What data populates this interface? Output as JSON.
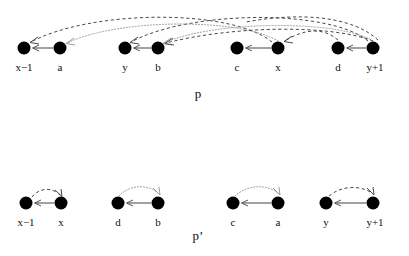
{
  "figure": {
    "title": "",
    "background_color": "#ffffff",
    "node_color": "#000000",
    "solid_edge_color": "#555555",
    "dashed_arc_color": "#4a4a4a",
    "dotted_arc_color": "#9a9a9a"
  },
  "panels": [
    {
      "id": "panel-p",
      "caption": "p",
      "caption_x": 198,
      "caption_y": 92,
      "node_y": 48,
      "label_y": 58,
      "nodes": [
        {
          "id": "n-xm1",
          "label": "x−1",
          "cx": 24,
          "cy": 48,
          "r": 6.5
        },
        {
          "id": "n-a",
          "label": "a",
          "cx": 60,
          "cy": 48,
          "r": 6.5
        },
        {
          "id": "n-y",
          "label": "y",
          "cx": 125,
          "cy": 48,
          "r": 6.5
        },
        {
          "id": "n-b",
          "label": "b",
          "cx": 158,
          "cy": 48,
          "r": 6.5
        },
        {
          "id": "n-c",
          "label": "c",
          "cx": 237,
          "cy": 48,
          "r": 6.5
        },
        {
          "id": "n-x",
          "label": "x",
          "cx": 278,
          "cy": 48,
          "r": 6.5
        },
        {
          "id": "n-d",
          "label": "d",
          "cx": 338,
          "cy": 48,
          "r": 6.5
        },
        {
          "id": "n-yp1",
          "label": "y+1",
          "cx": 373,
          "cy": 48,
          "r": 6.5
        }
      ],
      "solid_edges": [
        {
          "id": "e-a-xm1",
          "from": "a",
          "to": "x−1",
          "x1": 53,
          "x2": 33,
          "y": 48
        },
        {
          "id": "e-b-y",
          "from": "b",
          "to": "y",
          "x1": 151,
          "x2": 134,
          "y": 48
        },
        {
          "id": "e-x-c",
          "from": "x",
          "to": "c",
          "x1": 271,
          "x2": 246,
          "y": 48
        },
        {
          "id": "e-yp1-d",
          "from": "y+1",
          "to": "d",
          "x1": 366,
          "x2": 347,
          "y": 48
        }
      ],
      "curved_arcs": [
        {
          "id": "arc-x-xm1",
          "style": "dashed",
          "from": "x",
          "to": "x−1",
          "d": "M 272 42 C 230 8, 90 10, 31 42"
        },
        {
          "id": "arc-yp1-y",
          "style": "dashed",
          "from": "y+1",
          "to": "y",
          "d": "M 368 41 C 330 9, 190 10, 131 42"
        },
        {
          "id": "arc-b-a",
          "style": "dotted",
          "from": "b",
          "to": "a",
          "d": "M 278 41 C 240 18, 120 18, 67 43"
        },
        {
          "id": "arc-d-c",
          "style": "dotted",
          "from": "d",
          "to": "c",
          "d": "M 373 41 C 340 20, 215 20, 164 43"
        },
        {
          "id": "arc-cross1",
          "style": "dashed",
          "from": "y+1",
          "to": "b",
          "d": "M 373 41 C 330 24, 230 26, 165 43"
        },
        {
          "id": "arc-cross2",
          "style": "dashed",
          "from": "d",
          "to": "x",
          "d": "M 338 41 C 320 26, 300 30, 284 42"
        }
      ]
    },
    {
      "id": "panel-p-prime",
      "caption": "p’",
      "caption_x": 198,
      "caption_y": 232,
      "node_y": 203,
      "label_y": 213,
      "nodes": [
        {
          "id": "p2-xm1",
          "label": "x−1",
          "cx": 26,
          "cy": 203,
          "r": 6.5
        },
        {
          "id": "p2-x",
          "label": "x",
          "cx": 61,
          "cy": 203,
          "r": 6.5
        },
        {
          "id": "p2-d",
          "label": "d",
          "cx": 118,
          "cy": 203,
          "r": 6.5
        },
        {
          "id": "p2-b",
          "label": "b",
          "cx": 158,
          "cy": 203,
          "r": 6.5
        },
        {
          "id": "p2-c",
          "label": "c",
          "cx": 233,
          "cy": 203,
          "r": 6.5
        },
        {
          "id": "p2-a",
          "label": "a",
          "cx": 278,
          "cy": 203,
          "r": 6.5
        },
        {
          "id": "p2-y",
          "label": "y",
          "cx": 326,
          "cy": 203,
          "r": 6.5
        },
        {
          "id": "p2-yp1",
          "label": "y+1",
          "cx": 373,
          "cy": 203,
          "r": 6.5
        }
      ],
      "solid_edges": [
        {
          "id": "p2-e-x-xm1",
          "from": "x",
          "to": "x−1",
          "x1": 54,
          "x2": 35,
          "y": 203
        },
        {
          "id": "p2-e-b-d",
          "from": "b",
          "to": "d",
          "x1": 151,
          "x2": 127,
          "y": 203
        },
        {
          "id": "p2-e-a-c",
          "from": "a",
          "to": "c",
          "x1": 271,
          "x2": 242,
          "y": 203
        },
        {
          "id": "p2-e-yp1-y",
          "from": "y+1",
          "to": "y",
          "x1": 366,
          "x2": 335,
          "y": 203
        }
      ],
      "curved_arcs": [
        {
          "id": "p2-arc-1",
          "style": "dashed",
          "from": "x−1",
          "to": "x",
          "d": "M 32 197 C 40 188, 52 188, 60 196"
        },
        {
          "id": "p2-arc-2",
          "style": "dotted",
          "from": "d",
          "to": "b",
          "d": "M 119 196 C 130 185, 148 185, 159 195"
        },
        {
          "id": "p2-arc-3",
          "style": "dotted",
          "from": "c",
          "to": "a",
          "d": "M 235 196 C 248 185, 268 185, 279 195"
        },
        {
          "id": "p2-arc-4",
          "style": "dashed",
          "from": "y",
          "to": "y+1",
          "d": "M 329 196 C 342 186, 362 186, 373 195"
        }
      ]
    }
  ]
}
